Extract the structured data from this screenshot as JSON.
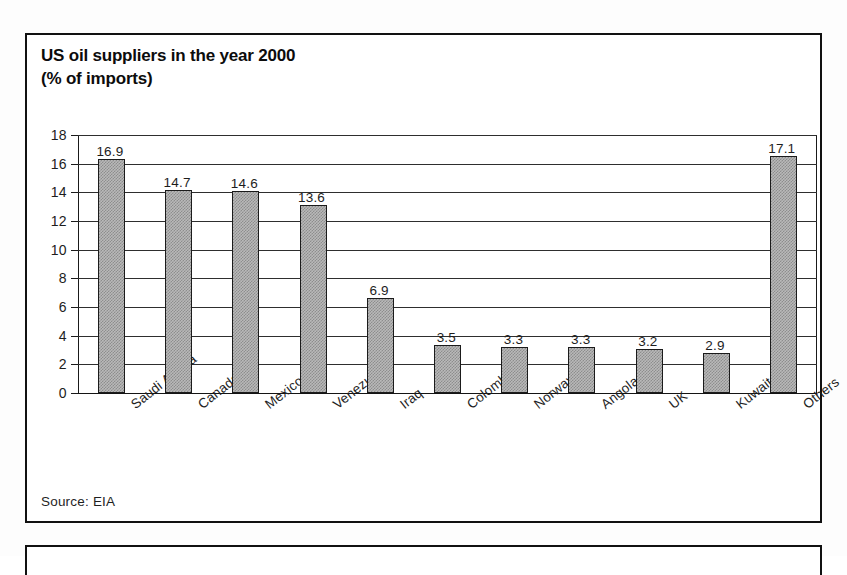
{
  "panel": {
    "title_line1": "US oil suppliers in the year 2000",
    "title_line2": "(% of imports)",
    "source": "Source: EIA"
  },
  "chart_data": {
    "type": "bar",
    "title": "US oil suppliers in the year 2000 (% of imports)",
    "xlabel": "",
    "ylabel": "",
    "ylim": [
      0,
      18
    ],
    "ytick_step": 2,
    "yticks": [
      "18",
      "16",
      "14",
      "12",
      "10",
      "8",
      "6",
      "4",
      "2",
      "0"
    ],
    "grid": true,
    "legend": "none",
    "bar_fill": "#b9b9b9",
    "bar_edge": "#1b1b1b",
    "categories": [
      "Saudi Arabia",
      "Canada",
      "Mexico",
      "Venezuela",
      "Iraq",
      "Colombia",
      "Norway",
      "Angola",
      "UK",
      "Kuwait",
      "Others"
    ],
    "values": [
      16.9,
      14.7,
      14.6,
      13.6,
      6.9,
      3.5,
      3.3,
      3.3,
      3.2,
      2.9,
      17.1
    ],
    "value_labels": [
      "16.9",
      "14.7",
      "14.6",
      "13.6",
      "6.9",
      "3.5",
      "3.3",
      "3.3",
      "3.2",
      "2.9",
      "17.1"
    ],
    "source": "Source: EIA"
  }
}
